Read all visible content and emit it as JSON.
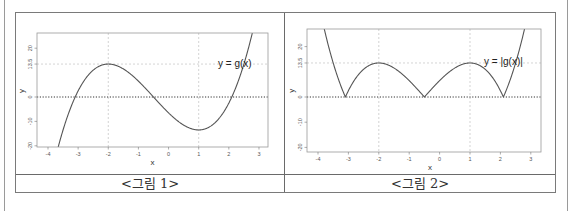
{
  "captions": {
    "fig1": "<그림 1>",
    "fig2": "<그림 2>"
  },
  "colors": {
    "curve": "#555555",
    "grid": "#c8c8c8",
    "zero_line": "#333333",
    "frame": "#999999"
  },
  "chart_data": [
    {
      "type": "line",
      "title": "",
      "caption": "<그림 1>",
      "function": "g(x) = 2x^3 + 3x^2 - 12x - 6.5",
      "annotation": "y = g(x)",
      "xlabel": "x",
      "ylabel": "y",
      "xlim": [
        -4.35,
        3.3
      ],
      "ylim": [
        -20.5,
        26.5
      ],
      "x_ticks": [
        -4,
        -3,
        -2,
        -1,
        0,
        1,
        2,
        3
      ],
      "y_ticks": [
        -20,
        -10,
        0,
        13.5,
        20
      ],
      "y_tick_labels": [
        "-20",
        "-10",
        "0",
        "13.5",
        "20"
      ],
      "grid": {
        "vertical_dotted": [
          -2,
          1
        ],
        "horizontal_dotted": [
          13.5
        ],
        "zero_line": true
      },
      "key_points": [
        {
          "x": -3.1,
          "y": 0,
          "label": "root"
        },
        {
          "x": -2,
          "y": 13.5,
          "label": "local max"
        },
        {
          "x": -0.5,
          "y": 0,
          "label": "root"
        },
        {
          "x": 1,
          "y": -13.5,
          "label": "local min"
        },
        {
          "x": 2.1,
          "y": 0,
          "label": "root"
        }
      ],
      "abs": false
    },
    {
      "type": "line",
      "title": "",
      "caption": "<그림 2>",
      "function": "|g(x)|",
      "annotation": "y = |g(x)|",
      "xlabel": "x",
      "ylabel": "y",
      "xlim": [
        -4.35,
        3.3
      ],
      "ylim": [
        -21.5,
        27
      ],
      "x_ticks": [
        -4,
        -3,
        -2,
        -1,
        0,
        1,
        2,
        3
      ],
      "y_ticks": [
        -20,
        -10,
        0,
        13.5,
        20
      ],
      "y_tick_labels": [
        "-20",
        "-10",
        "0",
        "13.5",
        "20"
      ],
      "grid": {
        "vertical_dotted": [
          -2,
          1
        ],
        "horizontal_dotted": [
          13.5
        ],
        "zero_line": true
      },
      "key_points": [
        {
          "x": -3.1,
          "y": 0,
          "label": "cusp"
        },
        {
          "x": -2,
          "y": 13.5,
          "label": "local max"
        },
        {
          "x": -0.5,
          "y": 0,
          "label": "cusp"
        },
        {
          "x": 1,
          "y": 13.5,
          "label": "local max"
        },
        {
          "x": 2.1,
          "y": 0,
          "label": "cusp"
        }
      ],
      "abs": true
    }
  ],
  "layout": {
    "plots": [
      {
        "box": [
          37,
          33,
          268,
          147
        ],
        "x0px": 48,
        "xscale": 30.14,
        "y0px": 97,
        "yscale": 2.44,
        "label_pos": [
          218,
          67
        ]
      },
      {
        "box": [
          307,
          29,
          541,
          152
        ],
        "x0px": 318,
        "xscale": 30.4,
        "y0px": 97,
        "yscale": 2.52,
        "label_pos": [
          484,
          65
        ]
      }
    ]
  }
}
